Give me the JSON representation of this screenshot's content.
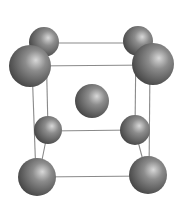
{
  "diagram": {
    "title": "",
    "background": "#ffffff",
    "edge_color": "#8a8a8a",
    "sphere_colors": {
      "highlight": "#d8d8d8",
      "mid": "#8c8c8c",
      "shadow": "#3e3e3e"
    },
    "atoms": [
      {
        "id": "top-back-left",
        "cx": 44,
        "cy": 42,
        "r": 15
      },
      {
        "id": "top-back-right",
        "cx": 138,
        "cy": 41,
        "r": 15
      },
      {
        "id": "top-front-left",
        "cx": 30,
        "cy": 66,
        "r": 21
      },
      {
        "id": "top-front-right",
        "cx": 153,
        "cy": 64,
        "r": 21
      },
      {
        "id": "body-center",
        "cx": 92,
        "cy": 101,
        "r": 17
      },
      {
        "id": "bottom-back-left",
        "cx": 48,
        "cy": 130,
        "r": 14
      },
      {
        "id": "bottom-back-right",
        "cx": 135,
        "cy": 130,
        "r": 15
      },
      {
        "id": "bottom-front-left",
        "cx": 37,
        "cy": 177,
        "r": 19
      },
      {
        "id": "bottom-front-right",
        "cx": 148,
        "cy": 175,
        "r": 19
      }
    ],
    "edges": [
      {
        "id": "top-back",
        "x1": 44,
        "y1": 43,
        "x2": 138,
        "y2": 43
      },
      {
        "id": "top-front",
        "x1": 30,
        "y1": 66,
        "x2": 153,
        "y2": 65
      },
      {
        "id": "top-left-depth",
        "x1": 44,
        "y1": 42,
        "x2": 30,
        "y2": 66
      },
      {
        "id": "top-right-depth",
        "x1": 138,
        "y1": 41,
        "x2": 153,
        "y2": 64
      },
      {
        "id": "left-back-vertical",
        "x1": 46,
        "y1": 42,
        "x2": 48,
        "y2": 130
      },
      {
        "id": "right-back-vertical",
        "x1": 136,
        "y1": 41,
        "x2": 135,
        "y2": 130
      },
      {
        "id": "left-front-vertical",
        "x1": 32,
        "y1": 66,
        "x2": 36,
        "y2": 177
      },
      {
        "id": "right-front-vertical",
        "x1": 150,
        "y1": 64,
        "x2": 149,
        "y2": 175
      },
      {
        "id": "bottom-back",
        "x1": 48,
        "y1": 131,
        "x2": 135,
        "y2": 130
      },
      {
        "id": "bottom-front",
        "x1": 37,
        "y1": 177,
        "x2": 148,
        "y2": 176
      },
      {
        "id": "bottom-left-depth",
        "x1": 48,
        "y1": 130,
        "x2": 40,
        "y2": 170
      },
      {
        "id": "bottom-right-depth",
        "x1": 135,
        "y1": 130,
        "x2": 145,
        "y2": 168
      }
    ]
  }
}
